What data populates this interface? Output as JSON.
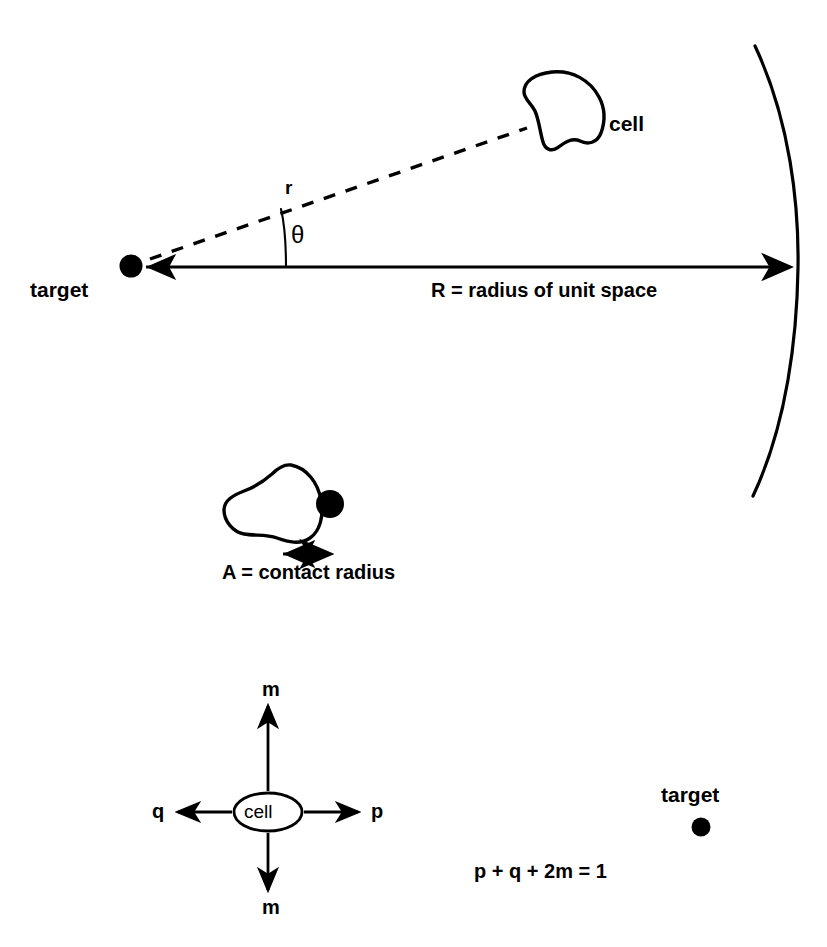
{
  "figure": {
    "background_color": "#ffffff",
    "ink_color": "#000000",
    "width": 827,
    "height": 947
  },
  "panel_top": {
    "target_label": "target",
    "cell_label": "cell",
    "distance_label": "r",
    "angle_label": "θ",
    "radius_label": "R = radius of unit space",
    "icons": {
      "target_dot": "filled-circle-icon",
      "cell_blob": "cell-blob-icon",
      "unit_space_arc": "arc-icon",
      "radius_arrow": "left-arrow-icon",
      "distance_line": "dashed-line-icon",
      "angle_arc": "angle-arc-icon"
    }
  },
  "panel_middle": {
    "contact_label": "A = contact radius",
    "icons": {
      "cell_blob": "cell-blob-icon",
      "contact_dot": "filled-circle-icon",
      "measure_arrow": "double-headed-arrow-icon"
    }
  },
  "panel_bottom": {
    "cell_label": "cell",
    "arrow_up_label": "m",
    "arrow_down_label": "m",
    "arrow_left_label": "q",
    "arrow_right_label": "p",
    "equation": "p + q + 2m = 1",
    "target_label": "target",
    "icons": {
      "cell_ellipse": "ellipse-icon",
      "arrow_up": "up-arrow-icon",
      "arrow_down": "down-arrow-icon",
      "arrow_left": "left-arrow-icon",
      "arrow_right": "right-arrow-icon",
      "target_dot": "filled-circle-icon"
    }
  }
}
